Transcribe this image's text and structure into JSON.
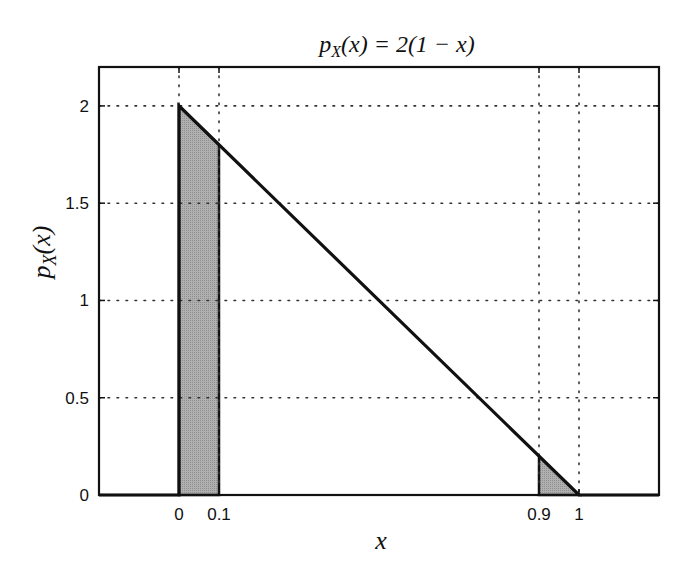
{
  "chart_data": {
    "type": "line",
    "title_parts": {
      "p": "p",
      "sub": "X",
      "rest_italic_open": "(x) = 2(1 − x)"
    },
    "xlabel": "x",
    "ylabel": "p_X(x)",
    "xlim": [
      -0.2,
      1.2
    ],
    "ylim": [
      0,
      2.2
    ],
    "grid": true,
    "grid_style": "dotted",
    "xticks": [
      0,
      0.1,
      0.9,
      1
    ],
    "xtick_labels": [
      "0",
      "0.1",
      "0.9",
      "1"
    ],
    "yticks": [
      0,
      0.5,
      1,
      1.5,
      2
    ],
    "ytick_labels": [
      "0",
      "0.5",
      "1",
      "1.5",
      "2"
    ],
    "series": [
      {
        "name": "p_X(x)",
        "x": [
          -0.2,
          0,
          0,
          1,
          1.2
        ],
        "y": [
          0,
          0,
          2,
          0,
          0
        ],
        "color": "#111111"
      }
    ],
    "shaded_regions": [
      {
        "x_from": 0,
        "x_to": 0.1,
        "y_left": 2.0,
        "y_right": 1.8,
        "color": "#a9a9a9"
      },
      {
        "x_from": 0.9,
        "x_to": 1.0,
        "y_left": 0.2,
        "y_right": 0.0,
        "color": "#a9a9a9"
      }
    ]
  },
  "labels": {
    "title_p": "p",
    "title_sub": "X",
    "title_rest": "(x) = 2(1 − x)",
    "xlabel": "x",
    "ylabel_p": "p",
    "ylabel_sub": "X",
    "ylabel_rest": "(x)"
  }
}
